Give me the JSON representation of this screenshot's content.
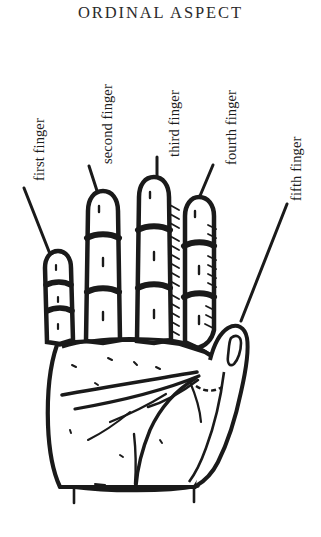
{
  "figure": {
    "title": "ORDINAL ASPECT",
    "background_color": "#ffffff",
    "ink_color": "#1a1a1a",
    "title_color": "#2b2b2b"
  },
  "labels": [
    {
      "id": "first",
      "text": "first finger",
      "rotation": -90
    },
    {
      "id": "second",
      "text": "second finger",
      "rotation": -90
    },
    {
      "id": "third",
      "text": "third finger",
      "rotation": -90
    },
    {
      "id": "fourth",
      "text": "fourth finger",
      "rotation": -90
    },
    {
      "id": "fifth",
      "text": "fifth finger",
      "rotation": -90
    }
  ],
  "leader_lines": [
    {
      "id": "first",
      "x1": 24,
      "y1": 188,
      "x2": 50,
      "y2": 254
    },
    {
      "id": "second",
      "x1": 89,
      "y1": 166,
      "x2": 99,
      "y2": 197
    },
    {
      "id": "third",
      "x1": 157,
      "y1": 157,
      "x2": 157,
      "y2": 182
    },
    {
      "id": "fourth",
      "x1": 213,
      "y1": 165,
      "x2": 197,
      "y2": 203
    },
    {
      "id": "fifth",
      "x1": 287,
      "y1": 204,
      "x2": 241,
      "y2": 321
    }
  ]
}
